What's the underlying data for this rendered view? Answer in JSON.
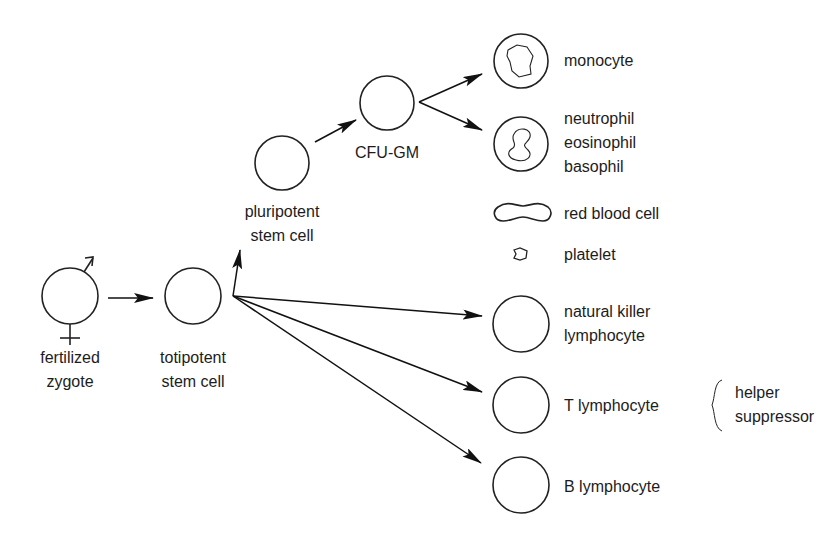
{
  "diagram": {
    "type": "hematopoiesis-lineage",
    "nodes": {
      "zygote": {
        "label_line1": "fertilized",
        "label_line2": "zygote",
        "symbols": [
          "male-symbol",
          "female-symbol"
        ]
      },
      "totipotent": {
        "label_line1": "totipotent",
        "label_line2": "stem cell"
      },
      "pluripotent": {
        "label_line1": "pluripotent",
        "label_line2": "stem cell"
      },
      "cfu_gm": {
        "label": "CFU-GM"
      },
      "monocyte": {
        "label": "monocyte"
      },
      "granulocytes": {
        "label_line1": "neutrophil",
        "label_line2": "eosinophil",
        "label_line3": "basophil"
      },
      "rbc": {
        "label": "red blood cell"
      },
      "platelet": {
        "label": "platelet"
      },
      "nk": {
        "label_line1": "natural killer",
        "label_line2": "lymphocyte"
      },
      "t_cell": {
        "label": "T lymphocyte",
        "subtypes": [
          "helper",
          "suppressor"
        ]
      },
      "b_cell": {
        "label": "B lymphocyte"
      }
    },
    "edges": [
      [
        "fertilized zygote",
        "totipotent stem cell"
      ],
      [
        "totipotent stem cell",
        "pluripotent stem cell"
      ],
      [
        "pluripotent stem cell",
        "CFU-GM"
      ],
      [
        "CFU-GM",
        "monocyte"
      ],
      [
        "CFU-GM",
        "neutrophil/eosinophil/basophil"
      ],
      [
        "totipotent stem cell",
        "natural killer lymphocyte"
      ],
      [
        "totipotent stem cell",
        "T lymphocyte"
      ],
      [
        "totipotent stem cell",
        "B lymphocyte"
      ]
    ],
    "t_subtypes": {
      "line1": "helper",
      "line2": "suppressor"
    }
  }
}
